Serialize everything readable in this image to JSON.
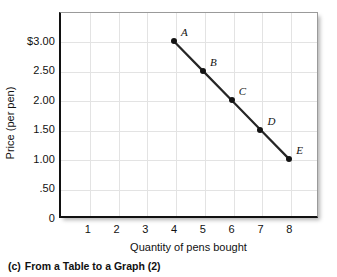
{
  "chart_data": {
    "type": "line",
    "title": "",
    "xlabel": "Quantity of pens bought",
    "ylabel": "Price (per pen)",
    "xlim": [
      0,
      9
    ],
    "ylim": [
      0,
      3.5
    ],
    "grid": true,
    "legend": "none",
    "x": [
      4,
      5,
      6,
      7,
      8
    ],
    "values": [
      3.0,
      2.5,
      2.0,
      1.5,
      1.0
    ],
    "point_labels": [
      "A",
      "B",
      "C",
      "D",
      "E"
    ],
    "series": [
      {
        "name": "Demand",
        "x": [
          4,
          5,
          6,
          7,
          8
        ],
        "values": [
          3.0,
          2.5,
          2.0,
          1.5,
          1.0
        ]
      }
    ],
    "points": [
      {
        "label": "A",
        "x": 4,
        "y": 3.0
      },
      {
        "label": "B",
        "x": 5,
        "y": 2.5
      },
      {
        "label": "C",
        "x": 6,
        "y": 2.0
      },
      {
        "label": "D",
        "x": 7,
        "y": 1.5
      },
      {
        "label": "E",
        "x": 8,
        "y": 1.0
      }
    ],
    "xticks": [
      "1",
      "2",
      "3",
      "4",
      "5",
      "6",
      "7",
      "8"
    ],
    "xtick_values": [
      1,
      2,
      3,
      4,
      5,
      6,
      7,
      8
    ],
    "yticks": [
      "0",
      ".50",
      "1.00",
      "1.50",
      "2.00",
      "2.50",
      "$3.00"
    ],
    "ytick_values": [
      0,
      0.5,
      1.0,
      1.5,
      2.0,
      2.5,
      3.0
    ],
    "line_color": "#262626",
    "marker_color": "#131313",
    "grid_color": "#e3e3e3",
    "axis_color": "#111111"
  },
  "caption": {
    "tag": "(c)",
    "text": "From a Table to a Graph (2)"
  }
}
